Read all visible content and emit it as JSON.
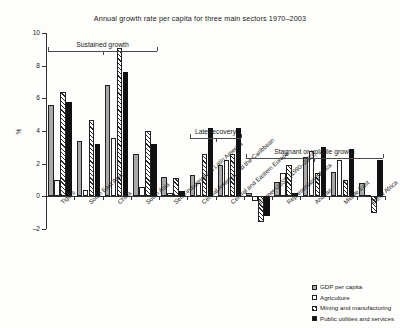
{
  "chart": {
    "title": "Annual growth rate per capita for three main sectors 1970–2003",
    "ylabel": "%"
  },
  "legend": {
    "items": [
      {
        "label": "GDP per capita",
        "swatch": "s0",
        "color": "#a8a8a8"
      },
      {
        "label": "Agriculture",
        "swatch": "s1",
        "color": "#ffffff"
      },
      {
        "label": "Mining and manufacturing",
        "swatch": "s2",
        "color": "#ffffff"
      },
      {
        "label": "Public utilities and services",
        "swatch": "s3",
        "color": "#111111"
      }
    ]
  },
  "annotations": [
    {
      "label": "Sustained growth",
      "from": 0,
      "to": 3
    },
    {
      "label": "Late recovery",
      "from": 5,
      "to": 6
    },
    {
      "label": "Stagnant or volatile growth",
      "from": 7,
      "to": 11
    }
  ],
  "chart_data": {
    "type": "bar",
    "title": "Annual growth rate per capita for three main sectors 1970–2003",
    "xlabel": "",
    "ylabel": "%",
    "ylim": [
      -2,
      10
    ],
    "yticks": [
      -2,
      0,
      2,
      4,
      6,
      8,
      10
    ],
    "grid": false,
    "legend_position": "bottom-right",
    "categories": [
      "Tigers",
      "South East Asia",
      "China",
      "South Asia",
      "Semi-industrialized Latin America",
      "Central America and the Caribbean",
      "Central and Eastern Europe",
      "Former USSR (1990–2003)",
      "Representative Africa",
      "Andean",
      "Middle East",
      "Other Africa"
    ],
    "series": [
      {
        "name": "GDP per capita",
        "values": [
          5.6,
          3.4,
          6.8,
          2.6,
          1.2,
          1.3,
          1.9,
          0.2,
          0.9,
          2.4,
          1.5,
          0.8
        ]
      },
      {
        "name": "Agriculture",
        "values": [
          1.0,
          0.4,
          3.6,
          0.6,
          0.2,
          0.8,
          2.2,
          -0.3,
          1.4,
          2.8,
          2.2,
          0.1
        ]
      },
      {
        "name": "Mining and manufacturing",
        "values": [
          6.4,
          4.7,
          9.1,
          4.0,
          1.1,
          2.6,
          2.6,
          -1.6,
          1.9,
          1.4,
          1.0,
          -1.0
        ]
      },
      {
        "name": "Public utilities and services",
        "values": [
          5.8,
          3.2,
          7.6,
          3.2,
          0.3,
          4.2,
          4.2,
          -1.2,
          0.2,
          3.0,
          2.9,
          2.2
        ]
      }
    ]
  }
}
